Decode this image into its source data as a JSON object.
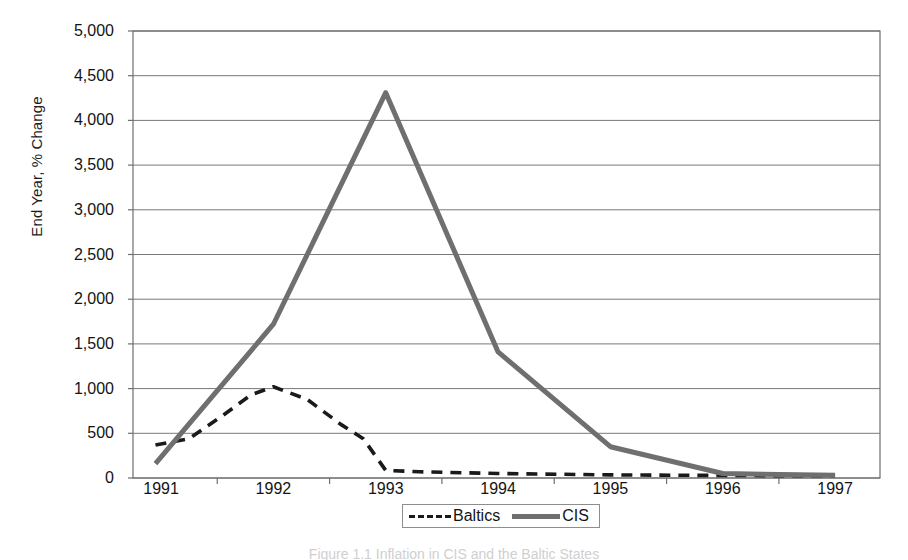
{
  "chart_data": {
    "type": "line",
    "title": "",
    "xlabel": "",
    "ylabel": "End Year, % Change",
    "x": [
      1991,
      1992,
      1993,
      1994,
      1995,
      1996,
      1997
    ],
    "xtick_labels": [
      "1991",
      "1992",
      "1993",
      "1994",
      "1995",
      "1996",
      "1997"
    ],
    "ytick_labels": [
      "0",
      "500",
      "1,000",
      "1,500",
      "2,000",
      "2,500",
      "3,000",
      "3,500",
      "4,000",
      "4,500",
      "5,000"
    ],
    "ytick_values": [
      0,
      500,
      1000,
      1500,
      2000,
      2500,
      3000,
      3500,
      4000,
      4500,
      5000
    ],
    "ylim": [
      0,
      5000
    ],
    "xlim": [
      1990.75,
      1997.4
    ],
    "grid": true,
    "legend_position": "bottom-center",
    "series": [
      {
        "name": "Baltics",
        "style": "dashed",
        "color": "#1a1a1a",
        "values": [
          370,
          1020,
          85,
          50,
          35,
          28,
          25
        ],
        "detail_points": [
          {
            "x": 1990.95,
            "y": 370
          },
          {
            "x": 1991.25,
            "y": 440
          },
          {
            "x": 1991.55,
            "y": 700
          },
          {
            "x": 1991.8,
            "y": 930
          },
          {
            "x": 1992.0,
            "y": 1020
          },
          {
            "x": 1992.3,
            "y": 880
          },
          {
            "x": 1992.6,
            "y": 600
          },
          {
            "x": 1992.8,
            "y": 440
          },
          {
            "x": 1993.0,
            "y": 85
          },
          {
            "x": 1993.3,
            "y": 70
          },
          {
            "x": 1994.0,
            "y": 50
          },
          {
            "x": 1995.0,
            "y": 35
          },
          {
            "x": 1996.0,
            "y": 28
          },
          {
            "x": 1997.0,
            "y": 25
          }
        ]
      },
      {
        "name": "CIS",
        "style": "solid",
        "color": "#6f6f6f",
        "values": [
          160,
          1720,
          4310,
          1410,
          350,
          50,
          30
        ],
        "detail_points": [
          {
            "x": 1990.95,
            "y": 160
          },
          {
            "x": 1992.0,
            "y": 1720
          },
          {
            "x": 1993.0,
            "y": 4310
          },
          {
            "x": 1994.0,
            "y": 1410
          },
          {
            "x": 1995.0,
            "y": 350
          },
          {
            "x": 1996.0,
            "y": 50
          },
          {
            "x": 1997.0,
            "y": 30
          }
        ]
      }
    ]
  },
  "legend": {
    "items": [
      {
        "label": "Baltics"
      },
      {
        "label": "CIS"
      }
    ]
  },
  "caption": {
    "text": "Figure 1.1  Inflation in CIS and the Baltic States"
  }
}
